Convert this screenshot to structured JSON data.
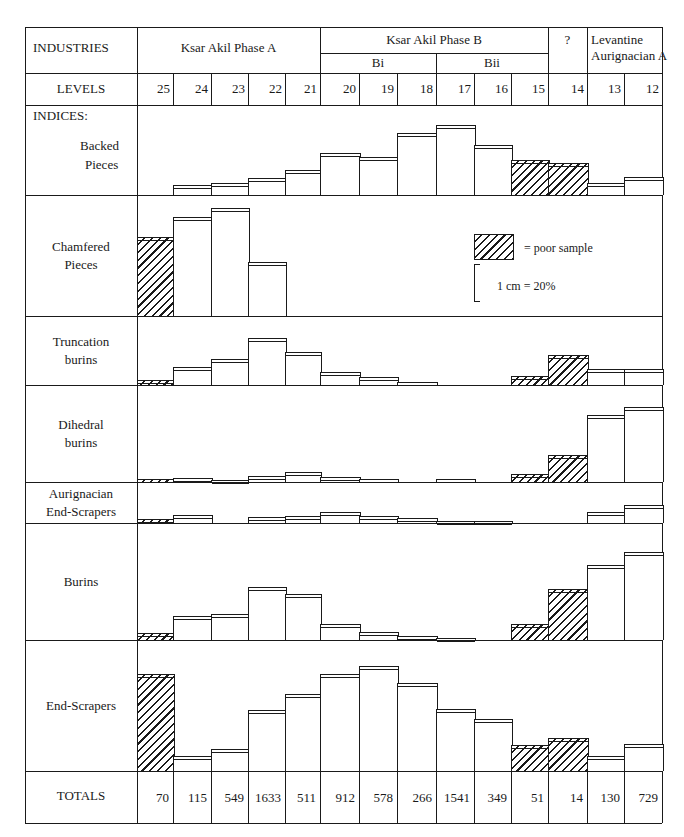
{
  "header": {
    "industries_label": "INDUSTRIES",
    "levels_label": "LEVELS",
    "indices_label": "INDICES:",
    "totals_label": "TOTALS",
    "groups": [
      {
        "label": "Ksar Akil Phase A",
        "levels": [
          "25",
          "24",
          "23",
          "22",
          "21"
        ]
      },
      {
        "label": "Ksar Akil Phase B",
        "subgroups": [
          {
            "label": "Bi",
            "levels": [
              "20",
              "19",
              "18"
            ]
          },
          {
            "label": "Bii",
            "levels": [
              "17",
              "16",
              "15"
            ]
          }
        ]
      },
      {
        "label": "?",
        "levels": [
          "14"
        ]
      },
      {
        "label": "Levantine Aurignacian A",
        "label_line1": "Levantine",
        "label_line2": "Aurignacian A",
        "levels": [
          "13",
          "12"
        ]
      }
    ]
  },
  "legend": {
    "hatch_label": "=   poor sample",
    "scale_label": "1 cm = 20%"
  },
  "chart_data": {
    "type": "bar",
    "title": "",
    "xlabel": "LEVELS",
    "ylabel": "Index (%)",
    "scale": "1 cm = 20%",
    "categories": [
      "25",
      "24",
      "23",
      "22",
      "21",
      "20",
      "19",
      "18",
      "17",
      "16",
      "15",
      "14",
      "13",
      "12"
    ],
    "poor_sample_levels": [
      "25",
      "15",
      "14"
    ],
    "totals": [
      70,
      115,
      549,
      1633,
      511,
      912,
      578,
      266,
      1541,
      349,
      51,
      14,
      130,
      729
    ],
    "series": [
      {
        "name": "Backed Pieces",
        "label_line1": "Backed",
        "label_line2": "Pieces",
        "values": [
          0,
          5,
          6,
          9,
          14,
          23,
          21,
          34,
          38,
          27,
          19,
          17,
          6,
          10
        ],
        "bar_height_px": [
          0,
          10,
          12,
          17,
          25,
          42,
          38,
          62,
          70,
          50,
          35,
          32,
          12,
          18
        ]
      },
      {
        "name": "Chamfered Pieces",
        "label_line1": "Chamfered",
        "label_line2": "Pieces",
        "values": [
          43,
          54,
          58,
          29,
          0,
          0,
          0,
          0,
          0,
          0,
          0,
          0,
          0,
          0
        ],
        "bar_height_px": [
          79,
          99,
          108,
          54,
          0,
          0,
          0,
          0,
          0,
          0,
          0,
          0,
          0,
          0
        ]
      },
      {
        "name": "Truncation burins",
        "label_line1": "Truncation",
        "label_line2": "burins",
        "values": [
          3,
          10,
          14,
          25,
          18,
          7,
          4,
          2,
          0,
          0,
          5,
          16,
          9,
          9
        ],
        "bar_height_px": [
          5,
          18,
          26,
          47,
          33,
          13,
          8,
          3,
          0,
          0,
          9,
          30,
          16,
          16
        ]
      },
      {
        "name": "Dihedral burins",
        "label_line1": "Dihedral",
        "label_line2": "burins",
        "values": [
          2,
          2,
          1,
          3,
          5,
          3,
          2,
          0,
          2,
          0,
          4,
          15,
          36,
          41
        ],
        "bar_height_px": [
          3,
          4,
          2,
          6,
          10,
          5,
          3,
          0,
          3,
          0,
          8,
          27,
          67,
          75
        ]
      },
      {
        "name": "Aurignacian End-Scrapers",
        "label_line1": "Aurignacian",
        "label_line2": "End-Scrapers",
        "values": [
          2,
          4,
          0,
          3,
          4,
          6,
          4,
          3,
          1,
          1,
          0,
          0,
          6,
          10
        ],
        "bar_height_px": [
          4,
          8,
          0,
          6,
          7,
          11,
          7,
          5,
          2,
          2,
          0,
          0,
          11,
          18
        ]
      },
      {
        "name": "Burins",
        "label_line1": "Burins",
        "label_line2": "",
        "values": [
          4,
          13,
          14,
          29,
          25,
          9,
          4,
          2,
          1,
          0,
          9,
          28,
          41,
          48
        ],
        "bar_height_px": [
          7,
          24,
          26,
          53,
          46,
          16,
          8,
          4,
          2,
          0,
          16,
          51,
          75,
          88
        ]
      },
      {
        "name": "End-Scrapers",
        "label_line1": "End-Scrapers",
        "label_line2": "",
        "values": [
          52,
          8,
          12,
          33,
          42,
          52,
          57,
          48,
          34,
          28,
          14,
          18,
          8,
          15
        ],
        "bar_height_px": [
          97,
          15,
          22,
          61,
          77,
          97,
          105,
          88,
          62,
          52,
          26,
          33,
          15,
          27
        ]
      }
    ]
  }
}
